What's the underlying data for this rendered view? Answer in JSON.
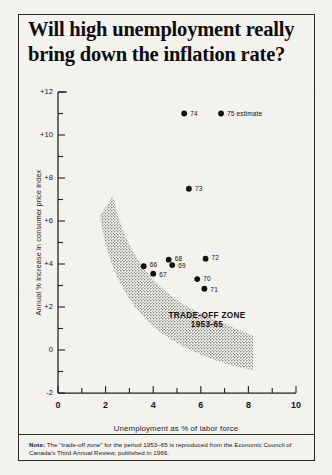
{
  "title": {
    "line1": "Will high unemployment really",
    "line2": "bring down the inflation rate?"
  },
  "note": {
    "prefix": "Note:",
    "text": "The \"trade-off zone\" for the period 1953–65 is reproduced from the Economic Council of Canada's Third Annual Review, published in 1966."
  },
  "zone": {
    "line1": "TRADE-OFF ZONE",
    "line2": "1953-65"
  },
  "chart_data": {
    "type": "scatter",
    "title": "Will high unemployment really bring down the inflation rate?",
    "xlabel": "Unemployment as % of labor force",
    "ylabel": "Annual % increase in consumer price index",
    "xlim": [
      0,
      10
    ],
    "ylim": [
      -2,
      12
    ],
    "xticks": [
      0,
      2,
      4,
      6,
      8,
      10
    ],
    "xtick_labels": [
      "0",
      "2",
      "4",
      "6",
      "8",
      "10"
    ],
    "xminor_step": 1,
    "yticks": [
      -2,
      0,
      2,
      4,
      6,
      8,
      10,
      12
    ],
    "ytick_labels": [
      "-2",
      "0",
      "+2",
      "+4",
      "+6",
      "+8",
      "+10",
      "+12"
    ],
    "yminor_step": 1,
    "grid": false,
    "legend": "none",
    "points": [
      {
        "label": "66",
        "x": 3.6,
        "y": 3.9,
        "label_dx": 6,
        "label_dy": -1
      },
      {
        "label": "67",
        "x": 4.0,
        "y": 3.55,
        "label_dx": 6,
        "label_dy": 1
      },
      {
        "label": "68",
        "x": 4.65,
        "y": 4.2,
        "label_dx": 6,
        "label_dy": -1
      },
      {
        "label": "69",
        "x": 4.8,
        "y": 3.95,
        "label_dx": 6,
        "label_dy": 1
      },
      {
        "label": "70",
        "x": 5.85,
        "y": 3.3,
        "label_dx": 6,
        "label_dy": 0
      },
      {
        "label": "71",
        "x": 6.15,
        "y": 2.85,
        "label_dx": 6,
        "label_dy": 1
      },
      {
        "label": "72",
        "x": 6.2,
        "y": 4.25,
        "label_dx": 6,
        "label_dy": -1
      },
      {
        "label": "73",
        "x": 5.5,
        "y": 7.5,
        "label_dx": 6,
        "label_dy": 0
      },
      {
        "label": "74",
        "x": 5.3,
        "y": 11.0,
        "label_dx": 6,
        "label_dy": 0
      },
      {
        "label": "75 estimate",
        "x": 6.85,
        "y": 11.0,
        "label_dx": 6,
        "label_dy": 0
      }
    ],
    "annotations": [
      {
        "name": "trade-off-zone",
        "text": "TRADE-OFF ZONE 1953-65",
        "kind": "shaded-band",
        "description": "Stippled band sweeping from upper-left (low unemployment, high inflation) down to lower-right (high unemployment, low inflation)"
      }
    ]
  },
  "colors": {
    "ink": "#111111",
    "paper": "#f4f2ee",
    "zone_fill": "#9a9a96"
  }
}
